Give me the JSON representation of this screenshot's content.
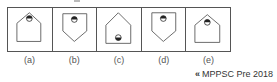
{
  "figure": {
    "options": [
      {
        "label": "(a)",
        "shape": "house-up",
        "circle_position": "top",
        "filled_half": "top"
      },
      {
        "label": "(b)",
        "shape": "house-down",
        "circle_position": "top",
        "filled_half": "top"
      },
      {
        "label": "(c)",
        "shape": "house-up",
        "circle_position": "bottom",
        "filled_half": "bottom"
      },
      {
        "label": "(d)",
        "shape": "house-down",
        "circle_position": "top",
        "filled_half": "top"
      },
      {
        "label": "(e)",
        "shape": "house-up",
        "circle_position": "top",
        "filled_half": "top"
      }
    ],
    "line_color": "#555555",
    "fill_color": "#222222"
  },
  "source": {
    "icon": "double-chevron-left-icon",
    "icon_glyph": "«",
    "text": "MPPSC Pre 2018"
  }
}
